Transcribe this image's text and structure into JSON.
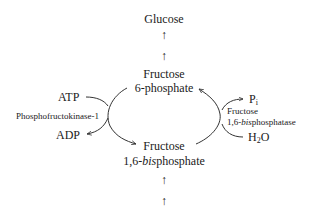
{
  "diagram": {
    "nodes": {
      "glucose": "Glucose",
      "f6p_line1": "Fructose",
      "f6p_line2": "6-phosphate",
      "f16bp_line1": "Fructose",
      "f16bp_line2_prefix": "1,6-",
      "f16bp_line2_italic": "bis",
      "f16bp_line2_suffix": "phosphate"
    },
    "left_reaction": {
      "enzyme": "Phosphofructokinase-1",
      "input": "ATP",
      "output": "ADP"
    },
    "right_reaction": {
      "enzyme_line1": "Fructose",
      "enzyme_line2_prefix": "1,6-",
      "enzyme_line2_italic": "bis",
      "enzyme_line2_suffix": "phosphatase",
      "input_main": "H",
      "input_sub": "2",
      "input_tail": "O",
      "output_main": "P",
      "output_sub": "i"
    },
    "arrows": {
      "up_glyph": "↑"
    },
    "colors": {
      "stroke": "#333333",
      "text": "#1a1a1a",
      "background": "#ffffff"
    }
  }
}
